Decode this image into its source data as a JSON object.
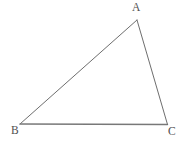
{
  "figure": {
    "kind": "geometry-diagram",
    "shape": "triangle",
    "width": 189,
    "height": 150,
    "background_color": "#ffffff",
    "stroke_color": "#6e6e6e",
    "baseline_stroke_color": "#787878",
    "label_color": "#4f4f4f",
    "stroke_width": 1,
    "baseline_stroke_width": 1.4,
    "vertices": [
      {
        "name": "A",
        "label": "A",
        "x": 137.0,
        "y": 20.0,
        "label_x": 132,
        "label_y": 2
      },
      {
        "name": "B",
        "label": "B",
        "x": 20.0,
        "y": 124.0,
        "label_x": 11,
        "label_y": 125
      },
      {
        "name": "C",
        "label": "C",
        "x": 167.5,
        "y": 124.5,
        "label_x": 168,
        "label_y": 126
      }
    ],
    "edges": [
      {
        "name": "AB",
        "from": "A",
        "to": "B",
        "x1": 137.0,
        "y1": 20.0,
        "x2": 20.0,
        "y2": 124.0
      },
      {
        "name": "BC",
        "from": "B",
        "to": "C",
        "x1": 20.0,
        "y1": 124.0,
        "x2": 167.5,
        "y2": 124.5
      },
      {
        "name": "CA",
        "from": "C",
        "to": "A",
        "x1": 167.5,
        "y1": 124.5,
        "x2": 137.0,
        "y2": 20.0
      }
    ]
  }
}
